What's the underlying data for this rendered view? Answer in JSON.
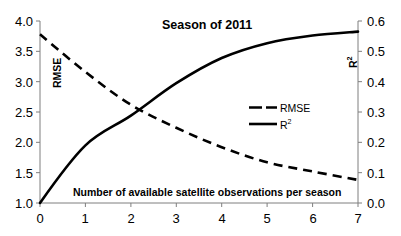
{
  "chart_data": {
    "type": "line",
    "title": "Season of 2011",
    "xlabel": "Number of available satellite observations per season",
    "ylabel": "RMSE",
    "y2label": "R²",
    "x": [
      0,
      1,
      2,
      3,
      4,
      5,
      6,
      7
    ],
    "xlim": [
      0,
      7
    ],
    "ylim": [
      1.0,
      4.0
    ],
    "y2lim": [
      0.0,
      0.6
    ],
    "xticks": [
      "0",
      "1",
      "2",
      "3",
      "4",
      "5",
      "6",
      "7"
    ],
    "yticks": [
      "1.0",
      "1.5",
      "2.0",
      "2.5",
      "3.0",
      "3.5",
      "4.0"
    ],
    "y2ticks": [
      "0.0",
      "0.1",
      "0.2",
      "0.3",
      "0.4",
      "0.5",
      "0.6"
    ],
    "grid": false,
    "legend_position": "center-right",
    "series": [
      {
        "name": "RMSE",
        "axis": "left",
        "style": "dashed",
        "color": "#000000",
        "values": [
          3.78,
          3.16,
          2.62,
          2.24,
          1.92,
          1.67,
          1.52,
          1.38
        ]
      },
      {
        "name": "R²",
        "axis": "right",
        "style": "solid",
        "color": "#000000",
        "values": [
          0.0,
          0.19,
          0.288,
          0.395,
          0.478,
          0.527,
          0.552,
          0.565
        ]
      }
    ],
    "annotations": [
      {
        "text": "RMSE",
        "kind": "inner-axis-label",
        "rotation": -90
      },
      {
        "text": "R²",
        "kind": "inner-axis-label",
        "rotation": -90
      }
    ]
  },
  "legend": {
    "entries": [
      {
        "label": "RMSE",
        "style": "dashed"
      },
      {
        "label": "R²",
        "style": "solid"
      }
    ]
  },
  "axes": {
    "left_label": "RMSE",
    "right_label": "R²"
  }
}
